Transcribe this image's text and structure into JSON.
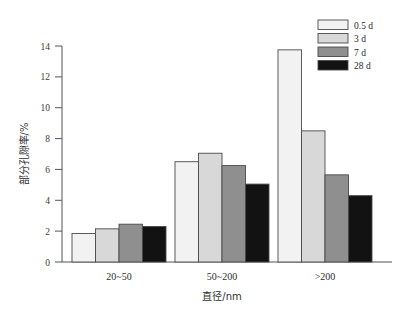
{
  "chart_data": {
    "type": "bar",
    "title": "",
    "subtitle": "",
    "xlabel": "直径/nm",
    "ylabel": "部分孔隙率/%",
    "categories": [
      "20~50",
      "50~200",
      ">200"
    ],
    "series": [
      {
        "name": "0.5 d",
        "values": [
          1.85,
          6.5,
          13.75
        ],
        "color": "#f2f2f2"
      },
      {
        "name": "3 d",
        "values": [
          2.15,
          7.05,
          8.5
        ],
        "color": "#d8d8d8"
      },
      {
        "name": "7 d",
        "values": [
          2.45,
          6.25,
          5.65
        ],
        "color": "#8f8f8f"
      },
      {
        "name": "28 d",
        "values": [
          2.3,
          5.05,
          4.3
        ],
        "color": "#121212"
      }
    ],
    "ylim": [
      0,
      14
    ],
    "yticks": [
      0,
      2,
      4,
      6,
      8,
      10,
      12,
      14
    ],
    "ytick_labels": [
      "0",
      "2",
      "4",
      "6",
      "8",
      "10",
      "12",
      "14"
    ],
    "grid": false,
    "legend_position": "top-right",
    "legend_entries": [
      "0.5 d",
      "3 d",
      "7 d",
      "28 d"
    ],
    "annotations": []
  },
  "axes": {
    "y_title": "部分孔隙率/%",
    "x_title": "直径/nm"
  }
}
